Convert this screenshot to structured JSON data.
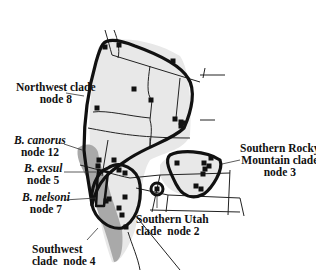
{
  "figure": {
    "type": "range map",
    "region": "western United States"
  },
  "labels": {
    "northwest": {
      "line1": "Northwest clade",
      "line2": "node 8"
    },
    "canorus": {
      "line1": "B. canorus",
      "line2": "node 12"
    },
    "exsul": {
      "line1": "B. exsul",
      "line2": "node 5"
    },
    "nelsoni": {
      "line1": "B. nelsoni",
      "line2": "node 7"
    },
    "southwest": {
      "line1": "Southwest",
      "line2": "clade  node 4"
    },
    "southern_utah": {
      "line1": "Southern Utah",
      "line2": "clade  node 2"
    },
    "southern_rocky": {
      "line1": "Southern Rocky",
      "line2": "Mountain clade",
      "line3": "node 3"
    }
  },
  "colors": {
    "outline": "#111111",
    "range_light": "#e6e6e6",
    "range_dark": "#a8a8a8",
    "marker": "#111111"
  },
  "markers": [
    [
      105,
      47
    ],
    [
      119,
      45
    ],
    [
      173,
      61
    ],
    [
      134,
      89
    ],
    [
      151,
      100
    ],
    [
      97,
      108
    ],
    [
      175,
      119
    ],
    [
      181,
      122
    ],
    [
      181,
      126
    ],
    [
      183,
      123
    ],
    [
      99,
      160
    ],
    [
      98,
      166
    ],
    [
      114,
      160
    ],
    [
      119,
      170
    ],
    [
      125,
      173
    ],
    [
      125,
      197
    ],
    [
      106,
      201
    ],
    [
      109,
      199
    ],
    [
      119,
      208
    ],
    [
      122,
      215
    ],
    [
      126,
      227
    ],
    [
      177,
      163
    ],
    [
      204,
      163
    ],
    [
      211,
      158
    ],
    [
      209,
      166
    ],
    [
      205,
      169
    ],
    [
      203,
      174
    ],
    [
      196,
      186
    ],
    [
      201,
      189
    ],
    [
      157,
      189
    ]
  ]
}
